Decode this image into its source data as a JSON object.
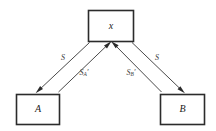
{
  "diagram": {
    "type": "node-edge-diagram",
    "background_color": "#ffffff",
    "stroke_color": "#2b2b2b",
    "edge_color": "#4a4a4a",
    "nodes": [
      {
        "id": "x",
        "label": "x",
        "position": "top-center"
      },
      {
        "id": "A",
        "label": "A",
        "position": "bottom-left"
      },
      {
        "id": "B",
        "label": "B",
        "position": "bottom-right"
      }
    ],
    "edges": [
      {
        "id": "x-to-A",
        "from": "x",
        "to": "A",
        "label": "S",
        "label_subscript": "",
        "label_prime": "",
        "direction": "x-to-A"
      },
      {
        "id": "A-to-x",
        "from": "A",
        "to": "x",
        "label": "S",
        "label_subscript": "A",
        "label_prime": "′",
        "direction": "A-to-x"
      },
      {
        "id": "B-to-x",
        "from": "B",
        "to": "x",
        "label": "S",
        "label_subscript": "B",
        "label_prime": "′",
        "direction": "B-to-x"
      },
      {
        "id": "x-to-B",
        "from": "x",
        "to": "B",
        "label": "S",
        "label_subscript": "",
        "label_prime": "",
        "direction": "x-to-B"
      }
    ]
  }
}
